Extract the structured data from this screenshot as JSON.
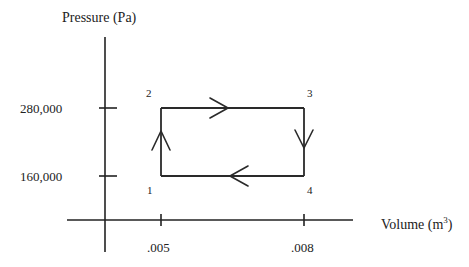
{
  "diagram": {
    "type": "pv-diagram",
    "y_axis_label": "Pressure (Pa)",
    "x_axis_label_base": "Volume (m",
    "x_axis_label_sup": "3",
    "x_axis_label_close": ")",
    "y_ticks": [
      {
        "value": 280000,
        "label": "280,000"
      },
      {
        "value": 160000,
        "label": "160,000"
      }
    ],
    "x_ticks": [
      {
        "value": 0.005,
        "label": ".005"
      },
      {
        "value": 0.008,
        "label": ".008"
      }
    ],
    "states": [
      {
        "id": "1",
        "label": "1",
        "volume": 0.005,
        "pressure": 160000
      },
      {
        "id": "2",
        "label": "2",
        "volume": 0.005,
        "pressure": 280000
      },
      {
        "id": "3",
        "label": "3",
        "volume": 0.008,
        "pressure": 280000
      },
      {
        "id": "4",
        "label": "4",
        "volume": 0.008,
        "pressure": 160000
      }
    ],
    "processes": [
      {
        "from": "1",
        "to": "2",
        "direction": "up"
      },
      {
        "from": "2",
        "to": "3",
        "direction": "right"
      },
      {
        "from": "3",
        "to": "4",
        "direction": "down"
      },
      {
        "from": "4",
        "to": "1",
        "direction": "left"
      }
    ]
  }
}
